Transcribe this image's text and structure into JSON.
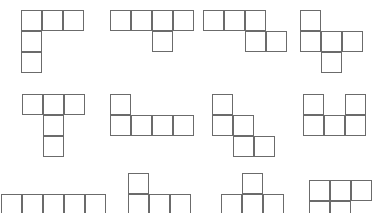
{
  "canvas": {
    "width": 372,
    "height": 213,
    "background": "#ffffff",
    "stroke_color": "#6b6b6b",
    "fill_color": "#ffffff",
    "stroke_width": 1.6,
    "cell_size": 21
  },
  "sheet": {
    "title": "Pentomino Shape Sheet",
    "columns": 4,
    "rows": 3,
    "description": "Grid of outlined pentomino puzzle pieces"
  },
  "shapes": [
    {
      "id": "shape-r1c1",
      "name": "v-pentomino",
      "row": 1,
      "column": 1,
      "origin": {
        "x": 21,
        "y": 10
      },
      "cell": 21,
      "cells": [
        [
          0,
          0
        ],
        [
          1,
          0
        ],
        [
          2,
          0
        ],
        [
          0,
          1
        ],
        [
          0,
          2
        ]
      ]
    },
    {
      "id": "shape-r1c2",
      "name": "y-pentomino",
      "row": 1,
      "column": 2,
      "origin": {
        "x": 110,
        "y": 10
      },
      "cell": 21,
      "cells": [
        [
          0,
          0
        ],
        [
          1,
          0
        ],
        [
          2,
          0
        ],
        [
          3,
          0
        ],
        [
          2,
          1
        ]
      ]
    },
    {
      "id": "shape-r1c3",
      "name": "n-pentomino",
      "row": 1,
      "column": 3,
      "origin": {
        "x": 203,
        "y": 10
      },
      "cell": 21,
      "cells": [
        [
          0,
          0
        ],
        [
          1,
          0
        ],
        [
          2,
          0
        ],
        [
          2,
          1
        ],
        [
          3,
          1
        ]
      ]
    },
    {
      "id": "shape-r1c4",
      "name": "f-pentomino",
      "row": 1,
      "column": 4,
      "origin": {
        "x": 300,
        "y": 10
      },
      "cell": 21,
      "cells": [
        [
          0,
          0
        ],
        [
          0,
          1
        ],
        [
          1,
          1
        ],
        [
          2,
          1
        ],
        [
          1,
          2
        ]
      ]
    },
    {
      "id": "shape-r2c1",
      "name": "t-pentomino",
      "row": 2,
      "column": 1,
      "origin": {
        "x": 22,
        "y": 94
      },
      "cell": 21,
      "cells": [
        [
          0,
          0
        ],
        [
          1,
          0
        ],
        [
          2,
          0
        ],
        [
          1,
          1
        ],
        [
          1,
          2
        ]
      ]
    },
    {
      "id": "shape-r2c2",
      "name": "l-pentomino",
      "row": 2,
      "column": 2,
      "origin": {
        "x": 110,
        "y": 94
      },
      "cell": 21,
      "cells": [
        [
          0,
          0
        ],
        [
          0,
          1
        ],
        [
          1,
          1
        ],
        [
          2,
          1
        ],
        [
          3,
          1
        ]
      ]
    },
    {
      "id": "shape-r2c3",
      "name": "w-pentomino",
      "row": 2,
      "column": 3,
      "origin": {
        "x": 212,
        "y": 94
      },
      "cell": 21,
      "cells": [
        [
          0,
          0
        ],
        [
          0,
          1
        ],
        [
          1,
          1
        ],
        [
          1,
          2
        ],
        [
          2,
          2
        ]
      ]
    },
    {
      "id": "shape-r2c4",
      "name": "u-pentomino",
      "row": 2,
      "column": 4,
      "origin": {
        "x": 303,
        "y": 94
      },
      "cell": 21,
      "cells": [
        [
          0,
          0
        ],
        [
          2,
          0
        ],
        [
          0,
          1
        ],
        [
          1,
          1
        ],
        [
          2,
          1
        ]
      ]
    },
    {
      "id": "shape-r3c1",
      "name": "i-pentomino",
      "row": 3,
      "column": 1,
      "origin": {
        "x": 1,
        "y": 194
      },
      "cell": 21,
      "cells": [
        [
          0,
          0
        ],
        [
          1,
          0
        ],
        [
          2,
          0
        ],
        [
          3,
          0
        ],
        [
          4,
          0
        ]
      ]
    },
    {
      "id": "shape-r3c2",
      "name": "n-pentomino-variant",
      "row": 3,
      "column": 2,
      "origin": {
        "x": 128,
        "y": 173
      },
      "cell": 21,
      "cells": [
        [
          0,
          0
        ],
        [
          0,
          1
        ],
        [
          1,
          1
        ],
        [
          2,
          1
        ],
        [
          2,
          2
        ]
      ]
    },
    {
      "id": "shape-r3c3",
      "name": "plus-pentomino",
      "row": 3,
      "column": 3,
      "origin": {
        "x": 221,
        "y": 173
      },
      "cell": 21,
      "cells": [
        [
          1,
          0
        ],
        [
          0,
          1
        ],
        [
          1,
          1
        ],
        [
          2,
          1
        ],
        [
          1,
          2
        ]
      ]
    },
    {
      "id": "shape-r3c4",
      "name": "p-pentomino",
      "row": 3,
      "column": 4,
      "origin": {
        "x": 309,
        "y": 180
      },
      "cell": 21,
      "cells": [
        [
          0,
          0
        ],
        [
          1,
          0
        ],
        [
          2,
          0
        ],
        [
          0,
          1
        ],
        [
          1,
          1
        ]
      ]
    }
  ]
}
